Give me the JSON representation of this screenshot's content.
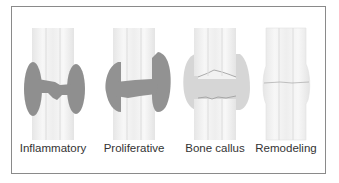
{
  "figure": {
    "stages": [
      {
        "id": "inflammatory",
        "label": "Inflammatory"
      },
      {
        "id": "proliferative",
        "label": "Proliferative"
      },
      {
        "id": "bone-callus",
        "label": "Bone callus"
      },
      {
        "id": "remodeling",
        "label": "Remodeling"
      }
    ],
    "colors": {
      "bone_fill": "#f4f4f4",
      "bone_stripe": "#e2e2e2",
      "hematoma": "#8f8f8f",
      "soft_callus": "#999999",
      "bony_callus": "#d6d6d6",
      "frame": "#8a8a8a",
      "text": "#333333"
    }
  }
}
